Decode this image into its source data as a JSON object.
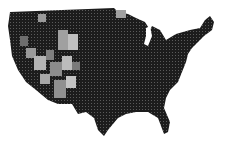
{
  "map": {
    "type": "choropleth",
    "region": "contiguous-united-states",
    "granularity": "county",
    "palette": {
      "background": "#ffffff",
      "darkest": "#1a1a1a",
      "dark": "#2e2e2e",
      "mid": "#6a6a6a",
      "light": "#a8a8a8",
      "lightest": "#cfcfcf"
    },
    "light_regions": [
      "west-interior",
      "great-basin",
      "southwest"
    ],
    "dark_regions": [
      "pacific-northwest",
      "great-plains",
      "midwest",
      "south",
      "northeast"
    ]
  }
}
